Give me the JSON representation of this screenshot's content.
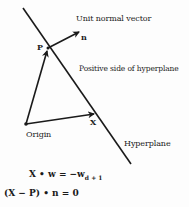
{
  "diagram": {
    "points": {
      "origin": {
        "label": "Origin",
        "x": 26,
        "y": 124
      },
      "p": {
        "label": "P",
        "x": 48,
        "y": 48
      },
      "x": {
        "label": "X",
        "x": 96,
        "y": 114
      },
      "n_tip": {
        "label": "n",
        "x": 81,
        "y": 31
      }
    },
    "lines": {
      "hyperplane": {
        "label": "Hyperplane",
        "x1": 23,
        "y1": 8,
        "x2": 131,
        "y2": 164
      }
    },
    "labels": {
      "unit_normal_vector": "Unit normal vector",
      "positive_side": "Positive side of hyperplane",
      "hyperplane": "Hyperplane",
      "origin": "Origin",
      "p": "P",
      "n": "n",
      "x": "X"
    },
    "equations": {
      "eq1_lhs": "X • w = −w",
      "eq1_sub": "d + 1",
      "eq2": "(X − P) • n = 0"
    },
    "colors": {
      "ink": "#1a1a1a",
      "background": "#fdfdfd"
    }
  }
}
